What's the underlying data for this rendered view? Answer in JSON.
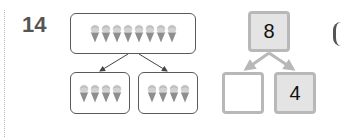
{
  "problem": {
    "number": "14"
  },
  "picture_bond": {
    "whole": {
      "icon": "ice-cream-cone-icon",
      "count": 8
    },
    "parts": [
      {
        "icon": "ice-cream-cone-icon",
        "count": 4
      },
      {
        "icon": "ice-cream-cone-icon",
        "count": 4
      }
    ]
  },
  "number_bond": {
    "whole": "8",
    "part_left": "",
    "part_right": "4"
  },
  "colors": {
    "box_border": "#5a5a5a",
    "bond_border": "#b8b8b8",
    "bond_fill": "#e4e4e4",
    "number_color": "#555555"
  }
}
